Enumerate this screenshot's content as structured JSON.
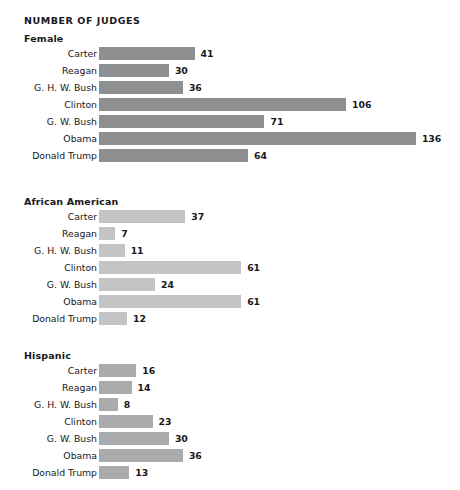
{
  "chart_data": {
    "type": "bar",
    "orientation": "horizontal",
    "title": "NUMBER OF JUDGES",
    "xlabel": "",
    "ylabel": "",
    "grid": false,
    "legend": "none",
    "xlim": [
      0,
      136
    ],
    "categories": [
      "Carter",
      "Reagan",
      "G. H. W. Bush",
      "Clinton",
      "G. W. Bush",
      "Obama",
      "Donald Trump"
    ],
    "panels": [
      {
        "name": "Female",
        "bar_color": "#8d8f91",
        "values": [
          41,
          30,
          36,
          106,
          71,
          136,
          64
        ]
      },
      {
        "name": "African American",
        "bar_color": "#c2c4c6",
        "values": [
          37,
          7,
          11,
          61,
          24,
          61,
          12
        ]
      },
      {
        "name": "Hispanic",
        "bar_color": "#a9abad",
        "values": [
          16,
          14,
          8,
          23,
          30,
          36,
          13
        ]
      }
    ],
    "series": [
      {
        "name": "Female",
        "categories": [
          "Carter",
          "Reagan",
          "G. H. W. Bush",
          "Clinton",
          "G. W. Bush",
          "Obama",
          "Donald Trump"
        ],
        "values": [
          41,
          30,
          36,
          106,
          71,
          136,
          64
        ]
      },
      {
        "name": "African American",
        "categories": [
          "Carter",
          "Reagan",
          "G. H. W. Bush",
          "Clinton",
          "G. W. Bush",
          "Obama",
          "Donald Trump"
        ],
        "values": [
          37,
          7,
          11,
          61,
          24,
          61,
          12
        ]
      },
      {
        "name": "Hispanic",
        "categories": [
          "Carter",
          "Reagan",
          "G. H. W. Bush",
          "Clinton",
          "G. W. Bush",
          "Obama",
          "Donald Trump"
        ],
        "values": [
          16,
          14,
          8,
          23,
          30,
          36,
          13
        ]
      }
    ]
  },
  "layout": {
    "px_per_unit": 2.33,
    "panel_tops": [
      15,
      196,
      350
    ],
    "title_top": 15,
    "background": "#ffffff"
  }
}
